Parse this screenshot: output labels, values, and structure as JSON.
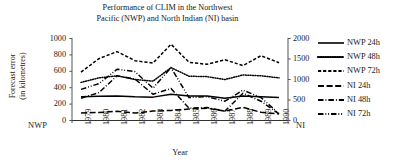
{
  "chart_data": {
    "type": "line",
    "title": "Performance of CLIM in the Northwest Pacific (NWP) and North Indian (NI) basin",
    "title_line1": "Performance of CLIM in the Northwest",
    "title_line2": "Pacific (NWP) and North Indian (NI) basin",
    "xlabel": "Year",
    "ylabel": "Forecast error (in kilometres)",
    "ylabel_line1": "Forecast error",
    "ylabel_line2": "(in kilometres)",
    "left_axis_corner_label": "NWP",
    "right_axis_corner_label": "NI",
    "grid": false,
    "legend_position": "right",
    "x": [
      "1979",
      "1980",
      "1981",
      "1982",
      "1983",
      "1984",
      "1985",
      "1986",
      "1987",
      "1988",
      "1989",
      "1990"
    ],
    "xtick_labels": [
      "1979",
      "1980",
      "1981",
      "1982",
      "1983",
      "1984",
      "1985",
      "1986",
      "1987",
      "1988",
      "1989",
      "1990"
    ],
    "ylim_left": [
      0,
      1000
    ],
    "ytick_labels_left": [
      "0",
      "200",
      "400",
      "600",
      "800",
      "1000"
    ],
    "ytick_values_left": [
      0,
      200,
      400,
      600,
      800,
      1000
    ],
    "ylim_right": [
      0,
      2000
    ],
    "ytick_labels_right": [
      "0",
      "500",
      "1000",
      "1500",
      "2000"
    ],
    "ytick_values_right": [
      0,
      500,
      1000,
      1500,
      2000
    ],
    "series": [
      {
        "name": "NWP 24h",
        "axis": "left",
        "style": "solid",
        "values": [
          290,
          295,
          300,
          290,
          285,
          320,
          300,
          300,
          270,
          300,
          290,
          280
        ]
      },
      {
        "name": "NWP 48h",
        "axis": "left",
        "style": "dotted",
        "values": [
          465,
          520,
          545,
          500,
          480,
          645,
          540,
          535,
          500,
          555,
          545,
          520
        ]
      },
      {
        "name": "NWP 72h",
        "axis": "left",
        "style": "dashed",
        "values": [
          590,
          755,
          840,
          730,
          700,
          930,
          710,
          685,
          740,
          670,
          790,
          705
        ]
      },
      {
        "name": "NI 24h",
        "axis": "right",
        "style": "long-dash",
        "values": [
          185,
          195,
          225,
          180,
          230,
          245,
          280,
          300,
          230,
          320,
          200,
          160
        ]
      },
      {
        "name": "NI 48h",
        "axis": "right",
        "style": "dash-dot",
        "values": [
          545,
          680,
          1090,
          1010,
          640,
          780,
          300,
          315,
          230,
          665,
          470,
          160
        ]
      },
      {
        "name": "NI 72h",
        "axis": "right",
        "style": "dash-dot-dot",
        "values": [
          760,
          900,
          1250,
          1190,
          790,
          1290,
          560,
          580,
          470,
          740,
          560,
          170
        ]
      }
    ],
    "legend": [
      {
        "label": "NWP 24h",
        "style": "solid"
      },
      {
        "label": "NWP 48h",
        "style": "dotted"
      },
      {
        "label": "NWP 72h",
        "style": "dashed"
      },
      {
        "label": "NI 24h",
        "style": "long-dash"
      },
      {
        "label": "NI 48h",
        "style": "dash-dot"
      },
      {
        "label": "NI 72h",
        "style": "dash-dot-dot"
      }
    ],
    "colors": {
      "line": "#000000",
      "axis": "#555555",
      "text": "#1a1a1a",
      "background": "#ffffff"
    }
  }
}
